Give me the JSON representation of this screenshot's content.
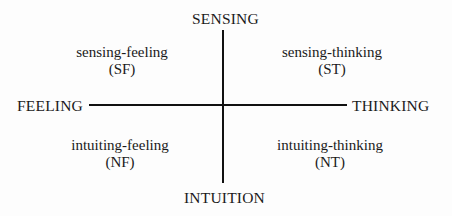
{
  "diagram": {
    "type": "quadrant",
    "axes": {
      "top": "SENSING",
      "bottom": "INTUITION",
      "left": "FEELING",
      "right": "THINKING"
    },
    "quadrants": [
      {
        "position": "top-left",
        "name": "sensing-feeling",
        "abbr": "(SF)"
      },
      {
        "position": "top-right",
        "name": "sensing-thinking",
        "abbr": "(ST)"
      },
      {
        "position": "bottom-left",
        "name": "intuiting-feeling",
        "abbr": "(NF)"
      },
      {
        "position": "bottom-right",
        "name": "intuiting-thinking",
        "abbr": "(NT)"
      }
    ],
    "colors": {
      "ink": "#111111",
      "background": "#fdfdfd"
    }
  }
}
